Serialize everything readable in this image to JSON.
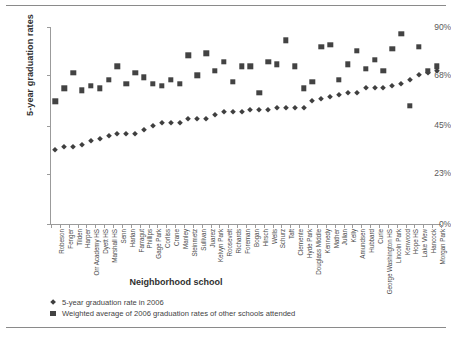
{
  "chart_data": {
    "type": "scatter",
    "title": "",
    "xlabel": "Neighborhood school",
    "ylabel": "5-year graduation rates",
    "ylim": [
      0,
      90
    ],
    "yticks": [
      0,
      23,
      45,
      68,
      90
    ],
    "ytick_labels": [
      "0%",
      "23%",
      "45%",
      "68%",
      "90%"
    ],
    "grid": false,
    "legend_position": "bottom-left",
    "categories": [
      "Robeson",
      "Fenger",
      "Tilden",
      "Harper",
      "Orr Academy HS",
      "Dyett HS",
      "Marshall HS",
      "Senn",
      "Harlan",
      "Farragut",
      "Phillips",
      "Gage Park",
      "Corliss",
      "Crane",
      "Manley",
      "Steinmetz",
      "Sullivan",
      "Juarez",
      "Kelvyn Park",
      "Roosevelt",
      "Richards",
      "Foreman",
      "Bogan",
      "Hirsch",
      "Wells",
      "Schurz",
      "Taft",
      "Clemente",
      "Hyde Park",
      "Douglass Middle",
      "Kennedy",
      "Mather",
      "Julian",
      "Kelly",
      "Amundsen",
      "Hubbard",
      "Curie",
      "George Washington HS",
      "Lincoln Park",
      "Kenwood",
      "Hope HS",
      "Lake View",
      "Hancock",
      "Morgan Park"
    ],
    "series": [
      {
        "name": "5-year graduation rate in 2006",
        "marker": "diamond",
        "color": "#3f3f3f",
        "values": [
          34,
          35,
          35,
          36,
          38,
          39,
          40,
          41,
          41,
          41,
          43,
          45,
          46,
          46,
          46,
          48,
          48,
          48,
          50,
          51,
          51,
          51,
          52,
          52,
          52,
          53,
          53,
          53,
          53,
          56,
          57,
          58,
          59,
          60,
          60,
          62,
          62,
          62,
          63,
          64,
          66,
          68,
          69,
          70
        ]
      },
      {
        "name": "Weighted average of 2006 graduation rates of other schools attended",
        "marker": "square",
        "color": "#434343",
        "values": [
          56,
          62,
          69,
          61,
          63,
          62,
          66,
          72,
          64,
          69,
          67,
          64,
          63,
          66,
          64,
          77,
          68,
          78,
          70,
          74,
          65,
          72,
          72,
          60,
          74,
          73,
          84,
          72,
          62,
          65,
          81,
          82,
          66,
          73,
          79,
          71,
          75,
          70,
          80,
          87,
          54,
          81,
          70,
          72
        ]
      }
    ]
  },
  "legend": {
    "items": [
      {
        "label": "5-year graduation rate in 2006",
        "marker": "diamond"
      },
      {
        "label": "Weighted average of 2006 graduation rates of other schools attended",
        "marker": "square"
      }
    ]
  }
}
